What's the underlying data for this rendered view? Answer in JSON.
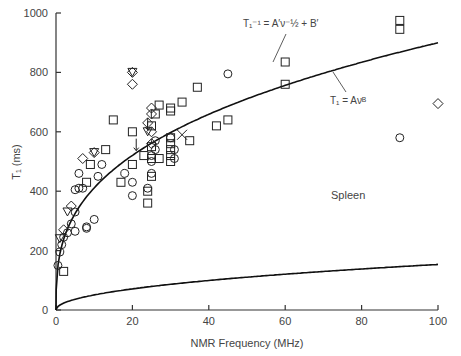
{
  "chart_data": {
    "type": "scatter",
    "title": "",
    "annotation_tissue": "Spleen",
    "xlabel": "NMR Frequency (MHz)",
    "ylabel": "T1 (ms)",
    "xlim": [
      0,
      100
    ],
    "ylim": [
      0,
      1000
    ],
    "xticks": [
      0,
      20,
      40,
      60,
      80,
      100
    ],
    "yticks": [
      0,
      200,
      400,
      600,
      800,
      1000
    ],
    "grid": false,
    "legend": "none",
    "fit_curves": [
      {
        "name": "T1^-1 = A'v^-1/2 + B'",
        "label": "T₁⁻¹ = A′ν⁻½ + B′",
        "model": "inverse_sqrt",
        "A": 0.061,
        "B": 0.00042
      },
      {
        "name": "T1 = Av^B",
        "label": "T₁ = Aνᴮ",
        "model": "power",
        "A": 188,
        "B": 0.34
      }
    ],
    "series": [
      {
        "name": "circle",
        "marker": "circle",
        "points": [
          [
            0.5,
            150
          ],
          [
            1,
            195
          ],
          [
            1.5,
            220
          ],
          [
            2,
            245
          ],
          [
            3,
            260
          ],
          [
            4,
            290
          ],
          [
            5,
            330
          ],
          [
            5,
            405
          ],
          [
            6,
            410
          ],
          [
            8,
            275
          ],
          [
            8,
            280
          ],
          [
            10,
            305
          ],
          [
            11,
            450
          ],
          [
            6,
            460
          ],
          [
            12,
            490
          ],
          [
            7,
            410
          ],
          [
            5,
            265
          ],
          [
            18,
            460
          ],
          [
            20,
            430
          ],
          [
            20,
            385
          ],
          [
            24,
            410
          ],
          [
            25,
            500
          ],
          [
            25,
            520
          ],
          [
            26,
            570
          ],
          [
            26,
            540
          ],
          [
            25,
            460
          ],
          [
            30,
            580
          ],
          [
            31,
            510
          ],
          [
            31,
            540
          ],
          [
            45,
            795
          ],
          [
            90,
            580
          ]
        ]
      },
      {
        "name": "square",
        "marker": "square",
        "points": [
          [
            2,
            130
          ],
          [
            8,
            430
          ],
          [
            9,
            490
          ],
          [
            13,
            540
          ],
          [
            15,
            640
          ],
          [
            17,
            430
          ],
          [
            20,
            490
          ],
          [
            20,
            600
          ],
          [
            23,
            520
          ],
          [
            24,
            360
          ],
          [
            24,
            400
          ],
          [
            25,
            450
          ],
          [
            25,
            510
          ],
          [
            25,
            550
          ],
          [
            25,
            620
          ],
          [
            26,
            660
          ],
          [
            27,
            690
          ],
          [
            27,
            510
          ],
          [
            30,
            500
          ],
          [
            30,
            520
          ],
          [
            30,
            540
          ],
          [
            30,
            560
          ],
          [
            30,
            580
          ],
          [
            30,
            680
          ],
          [
            30,
            670
          ],
          [
            33,
            700
          ],
          [
            35,
            570
          ],
          [
            37,
            750
          ],
          [
            42,
            620
          ],
          [
            45,
            640
          ],
          [
            60,
            835
          ],
          [
            60,
            760
          ],
          [
            90,
            975
          ],
          [
            90,
            945
          ]
        ]
      },
      {
        "name": "diamond",
        "marker": "diamond",
        "points": [
          [
            2,
            270
          ],
          [
            4,
            350
          ],
          [
            7,
            510
          ],
          [
            10,
            530
          ],
          [
            20,
            760
          ],
          [
            20,
            800
          ],
          [
            24,
            630
          ],
          [
            25,
            680
          ],
          [
            25,
            660
          ],
          [
            25,
            600
          ],
          [
            25,
            560
          ],
          [
            100,
            695
          ]
        ]
      },
      {
        "name": "triangle-down",
        "marker": "triangle",
        "points": [
          [
            1,
            240
          ],
          [
            3,
            330
          ],
          [
            20,
            800
          ],
          [
            24,
            600
          ],
          [
            10,
            530
          ]
        ]
      },
      {
        "name": "cross",
        "marker": "cross",
        "points": [
          [
            33,
            590
          ]
        ]
      },
      {
        "name": "arrow-down",
        "marker": "arrow",
        "points": [
          [
            21,
            550
          ],
          [
            24,
            620
          ]
        ]
      }
    ]
  }
}
